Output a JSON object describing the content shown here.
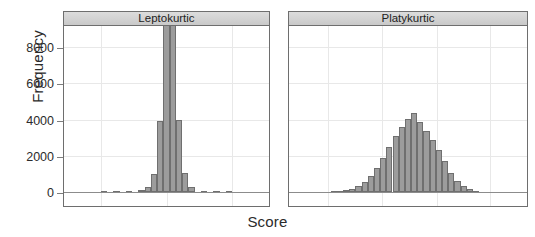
{
  "figure": {
    "xlabel": "Score",
    "ylabel": "Frequency"
  },
  "axis": {
    "y_ticks": [
      "0",
      "2000",
      "4000",
      "6000",
      "8000"
    ]
  },
  "panels": [
    {
      "title": "Leptokurtic"
    },
    {
      "title": "Platykurtic"
    }
  ],
  "colors": {
    "bar_fill": "#9c9c9c",
    "bar_border": "#6f6f6f",
    "strip_fill": "#d2d2d2",
    "panel_border": "#6e6e6e",
    "gridline": "#e8e8e8",
    "text": "#2b2b2b"
  },
  "chart_data": {
    "type": "bar",
    "title": "",
    "xlabel": "Score",
    "ylabel": "Frequency",
    "ylim": [
      0,
      10000
    ],
    "yticks": [
      0,
      2000,
      4000,
      6000,
      8000
    ],
    "grid": true,
    "legend": "none",
    "layout": "two panels side by side, shared y axis",
    "panels": [
      {
        "name": "Leptokurtic",
        "bin_centers": [
          -5.0,
          -4.0,
          -3.0,
          -2.0,
          -1.5,
          -1.0,
          -0.5,
          0.0,
          0.5,
          1.0,
          1.5,
          2.0,
          3.0,
          4.0,
          5.0
        ],
        "values": [
          10,
          20,
          40,
          90,
          250,
          980,
          3900,
          9400,
          9420,
          3980,
          1060,
          260,
          80,
          30,
          10
        ]
      },
      {
        "name": "Platykurtic",
        "bin_centers": [
          -6.0,
          -5.5,
          -5.0,
          -4.5,
          -4.0,
          -3.5,
          -3.0,
          -2.5,
          -2.0,
          -1.5,
          -1.0,
          -0.5,
          0.0,
          0.5,
          1.0,
          1.5,
          2.0,
          2.5,
          3.0,
          3.5,
          4.0,
          4.5,
          5.0,
          5.5
        ],
        "values": [
          20,
          40,
          90,
          170,
          320,
          560,
          900,
          1350,
          1850,
          2500,
          3080,
          3600,
          4050,
          4350,
          3880,
          3350,
          2850,
          2300,
          1700,
          1050,
          620,
          330,
          160,
          70
        ]
      }
    ]
  }
}
